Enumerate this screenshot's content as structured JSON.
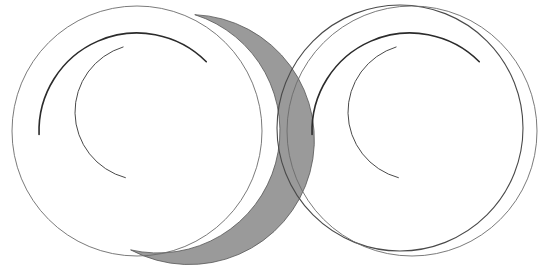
{
  "figure": {
    "width": 551,
    "height": 271,
    "background_color": "#ffffff",
    "panel_count": 2
  },
  "colors": {
    "background": "#ffffff",
    "thin_outline": "#6b6b6b",
    "medium_outline": "#4a4a4a",
    "dark_arc": "#2b2b2b",
    "lune_fill": "#9a9a9a",
    "lune_stroke": "#555555"
  },
  "strokes": {
    "thin_width": "0.9",
    "medium_width": "1.1",
    "dark_width": "1.6",
    "lune_edge_width": "0.8"
  },
  "chart_data": {
    "type": "scatter",
    "xlabel": "",
    "ylabel": "",
    "xlim": [
      0,
      551
    ],
    "ylim": [
      0,
      271
    ],
    "grid": false,
    "legend": "none",
    "panels": [
      {
        "name": "left-panel",
        "description": "Large circle with grey-filled crescent (lune) on its left flank, plus two inner arcs",
        "shapes": [
          {
            "id": "left-main-circle",
            "kind": "circle",
            "cx": 137,
            "cy": 131,
            "r": 125,
            "fill": "none",
            "stroke": "#6b6b6b",
            "stroke_width": 0.9
          },
          {
            "id": "left-lune-outer-circle",
            "kind": "circle",
            "cx": 137,
            "cy": 128,
            "r": 125,
            "fill": "none",
            "stroke": "none",
            "note": "outer boundary of the grey crescent, shifted left"
          },
          {
            "id": "left-lune",
            "kind": "lune",
            "outer": {
              "cx": 136,
              "cy": 125,
              "r": 125
            },
            "inner": {
              "cx": 158,
              "cy": 131,
              "r": 122
            },
            "fill": "#9a9a9a",
            "stroke": "#555555",
            "stroke_width": 0.8,
            "thickness_max_px": 25,
            "orientation": "left"
          },
          {
            "id": "left-dark-arc",
            "kind": "arc",
            "cx": 137,
            "cy": 131,
            "r": 98,
            "start_angle_deg": 178,
            "end_angle_deg": 315,
            "stroke": "#2b2b2b",
            "stroke_width": 1.6,
            "endpoint": [
              185,
              62
            ]
          },
          {
            "id": "left-inner-c-arc",
            "kind": "arc",
            "cx": 143,
            "cy": 112,
            "r": 68,
            "start_angle_deg": 105,
            "end_angle_deg": 253,
            "stroke": "#4a4a4a",
            "stroke_width": 1.0,
            "endpoint": [
              92,
              110
            ]
          }
        ],
        "extents": {
          "left": 11,
          "right": 263,
          "top": 17,
          "bottom": 252
        }
      },
      {
        "name": "right-panel",
        "description": "Two overlapping circles drawn as outlines only (unfilled lune), plus the same two inner arcs",
        "shapes": [
          {
            "id": "right-main-circle",
            "kind": "circle",
            "cx": 412,
            "cy": 131,
            "r": 125,
            "fill": "none",
            "stroke": "#6b6b6b",
            "stroke_width": 0.9
          },
          {
            "id": "right-offset-circle",
            "kind": "circle",
            "cx": 400,
            "cy": 128,
            "r": 123,
            "fill": "none",
            "stroke": "#4a4a4a",
            "stroke_width": 1.1
          },
          {
            "id": "right-dark-arc",
            "kind": "arc",
            "cx": 410,
            "cy": 131,
            "r": 98,
            "start_angle_deg": 178,
            "end_angle_deg": 315,
            "stroke": "#2b2b2b",
            "stroke_width": 1.6,
            "endpoint": [
              458,
              62
            ]
          },
          {
            "id": "right-inner-c-arc",
            "kind": "arc",
            "cx": 416,
            "cy": 112,
            "r": 68,
            "start_angle_deg": 105,
            "end_angle_deg": 253,
            "stroke": "#4a4a4a",
            "stroke_width": 1.0,
            "endpoint": [
              365,
              110
            ]
          }
        ],
        "extents": {
          "left": 277,
          "right": 537,
          "top": 17,
          "bottom": 252
        }
      }
    ]
  }
}
